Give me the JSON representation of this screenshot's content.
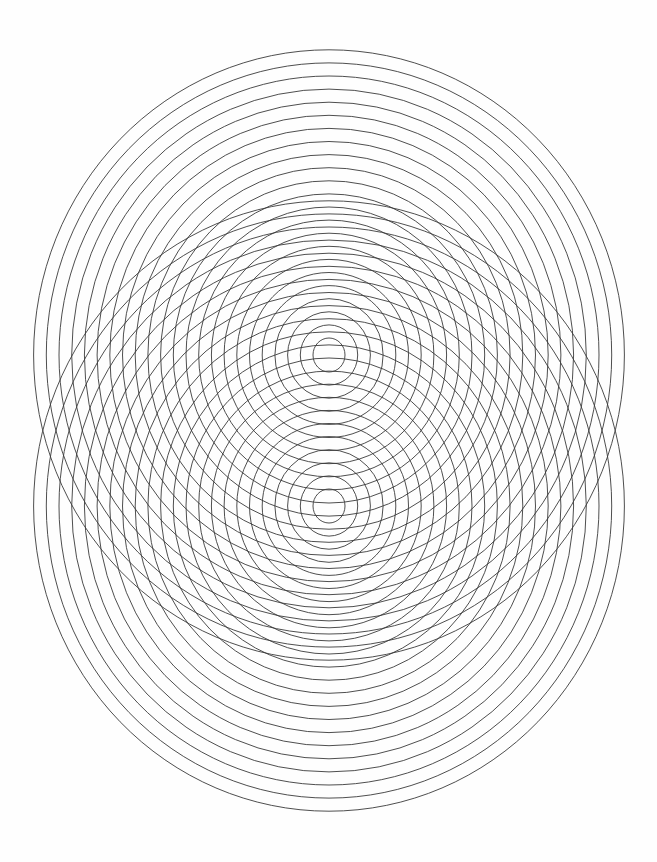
{
  "canvas": {
    "width": 657,
    "height": 862,
    "background_color": "#fefefe",
    "title": "Concentric Ellipse Interference Pattern"
  },
  "style": {
    "stroke_color": "#3a3a3a",
    "stroke_width": 0.9,
    "fill": "none"
  },
  "chart_data": {
    "type": "line",
    "xlabel": "",
    "ylabel": "",
    "xlim": [
      0,
      657
    ],
    "ylim": [
      0,
      862
    ],
    "grid": false,
    "legend": "none",
    "annotations": [],
    "series": [
      {
        "name": "upper-ellipse-family",
        "center_x": 329,
        "center_y": 355,
        "ring_count": 23,
        "rx_start": 16,
        "rx_step": 12.7,
        "ry_start": 17,
        "ry_step": 13.1,
        "rx_values": [
          16,
          28.7,
          41.4,
          54.1,
          66.8,
          79.5,
          92.2,
          104.9,
          117.6,
          130.3,
          143.0,
          155.7,
          168.4,
          181.1,
          193.8,
          206.5,
          219.2,
          231.9,
          244.6,
          257.3,
          270.0,
          282.7,
          295.4
        ],
        "ry_values": [
          17,
          30.1,
          43.2,
          56.3,
          69.4,
          82.5,
          95.6,
          108.7,
          121.8,
          134.9,
          148.0,
          161.1,
          174.2,
          187.3,
          200.4,
          213.5,
          226.6,
          239.7,
          252.8,
          265.9,
          279.0,
          292.1,
          305.2
        ]
      },
      {
        "name": "lower-ellipse-family",
        "center_x": 329,
        "center_y": 506,
        "ring_count": 23,
        "rx_start": 16,
        "rx_step": 12.7,
        "ry_start": 17,
        "ry_step": 13.1,
        "rx_values": [
          16,
          28.7,
          41.4,
          54.1,
          66.8,
          79.5,
          92.2,
          104.9,
          117.6,
          130.3,
          143.0,
          155.7,
          168.4,
          181.1,
          193.8,
          206.5,
          219.2,
          231.9,
          244.6,
          257.3,
          270.0,
          282.7,
          295.4
        ],
        "ry_values": [
          17,
          30.1,
          43.2,
          56.3,
          69.4,
          82.5,
          95.6,
          108.7,
          121.8,
          134.9,
          148.0,
          161.1,
          174.2,
          187.3,
          200.4,
          213.5,
          226.6,
          239.7,
          252.8,
          265.9,
          279.0,
          292.1,
          305.2
        ]
      }
    ]
  }
}
